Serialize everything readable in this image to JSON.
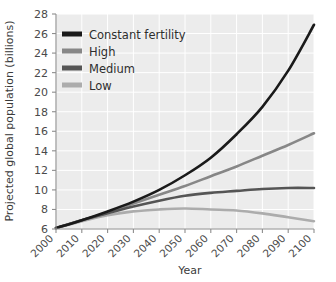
{
  "chart_data": {
    "type": "line",
    "title": "",
    "xlabel": "Year",
    "ylabel": "Projected global population (billions)",
    "xlim": [
      2000,
      2100
    ],
    "ylim": [
      6,
      28
    ],
    "xticks": [
      2000,
      2010,
      2020,
      2030,
      2040,
      2050,
      2060,
      2070,
      2080,
      2090,
      2100
    ],
    "yticks": [
      6,
      8,
      10,
      12,
      14,
      16,
      18,
      20,
      22,
      24,
      26,
      28
    ],
    "xtick_labels": [
      "2000",
      "2010",
      "2020",
      "2030",
      "2040",
      "2050",
      "2060",
      "2070",
      "2080",
      "2090",
      "2100"
    ],
    "ytick_labels": [
      "6",
      "8",
      "10",
      "12",
      "14",
      "16",
      "18",
      "20",
      "22",
      "24",
      "26",
      "28"
    ],
    "grid": true,
    "grid_color": "#ffffff",
    "plot_background": "#ececec",
    "figure_background": "#ffffff",
    "legend_position": "upper left",
    "x": [
      2000,
      2010,
      2020,
      2030,
      2040,
      2050,
      2060,
      2070,
      2080,
      2090,
      2100
    ],
    "series": [
      {
        "name": "Constant fertility",
        "color": "#1a1a1a",
        "linewidth": 2.6,
        "values": [
          6.1,
          6.9,
          7.8,
          8.8,
          10.0,
          11.5,
          13.3,
          15.7,
          18.5,
          22.2,
          26.9
        ]
      },
      {
        "name": "High",
        "color": "#878787",
        "linewidth": 2.6,
        "values": [
          6.1,
          6.9,
          7.7,
          8.6,
          9.5,
          10.4,
          11.4,
          12.4,
          13.5,
          14.6,
          15.8
        ]
      },
      {
        "name": "Medium",
        "color": "#555555",
        "linewidth": 2.6,
        "values": [
          6.1,
          6.9,
          7.6,
          8.3,
          8.9,
          9.4,
          9.7,
          9.9,
          10.1,
          10.2,
          10.2
        ]
      },
      {
        "name": "Low",
        "color": "#acacac",
        "linewidth": 2.6,
        "values": [
          6.1,
          6.8,
          7.4,
          7.8,
          8.0,
          8.1,
          8.0,
          7.9,
          7.6,
          7.2,
          6.8
        ]
      }
    ]
  },
  "axes": {
    "y_axis_title": "Projected global population (billions)",
    "x_axis_title": "Year"
  },
  "legend": {
    "items": [
      {
        "label": "Constant fertility",
        "swatch_color": "#1a1a1a"
      },
      {
        "label": "High",
        "swatch_color": "#878787"
      },
      {
        "label": "Medium",
        "swatch_color": "#555555"
      },
      {
        "label": "Low",
        "swatch_color": "#acacac"
      }
    ]
  }
}
